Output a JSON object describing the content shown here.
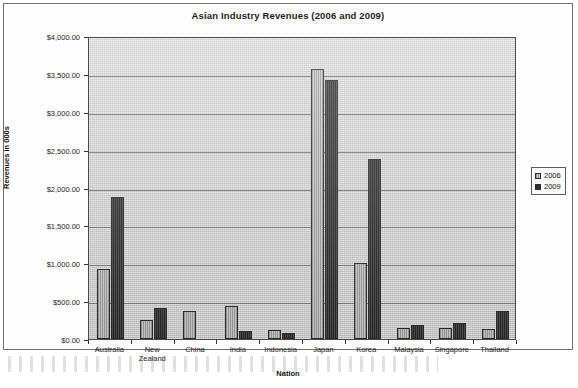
{
  "chart_data": {
    "type": "bar",
    "title": "Asian Industry Revenues (2006 and 2009)",
    "xlabel": "Nation",
    "ylabel": "Revenues in 000s",
    "ylim": [
      0,
      4000
    ],
    "ytick_step": 500,
    "grid": true,
    "legend_position": "right",
    "ytick_labels": [
      "$4,000.00",
      "$3,500.00",
      "$3,000.00",
      "$2,500.00",
      "$2,000.00",
      "$1,500.00",
      "$1,000.00",
      "$500.00",
      "$0.00"
    ],
    "ytick_values": [
      4000,
      3500,
      3000,
      2500,
      2000,
      1500,
      1000,
      500,
      0
    ],
    "categories": [
      "Australia",
      "New\nZealand",
      "China",
      "India",
      "Indonesia",
      "Japan",
      "Korea",
      "Malaysia",
      "Singapore",
      "Thailand"
    ],
    "series": [
      {
        "name": "2006",
        "color": "#b9b9b9",
        "values": [
          930,
          250,
          370,
          440,
          120,
          3560,
          1010,
          150,
          150,
          130
        ]
      },
      {
        "name": "2009",
        "color": "#3a3a3a",
        "values": [
          1880,
          415,
          0,
          105,
          80,
          3420,
          2370,
          185,
          205,
          375
        ]
      }
    ]
  },
  "legend": {
    "items": [
      {
        "label": "2006"
      },
      {
        "label": "2009"
      }
    ]
  },
  "colors": {
    "plot_background": "#cfcfcf",
    "axis": "#4a4a4a",
    "gridline": "#6b6b6b",
    "text": "#1d1d1d"
  }
}
